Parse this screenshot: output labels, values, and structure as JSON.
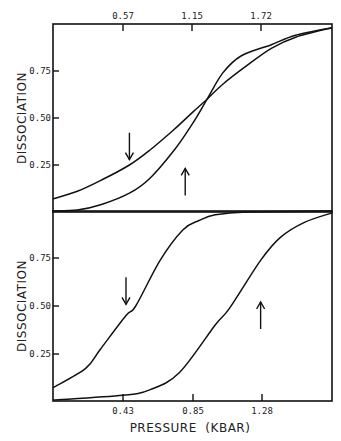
{
  "chart_data": [
    {
      "type": "line",
      "panel": "top",
      "title": "",
      "xlabel": "",
      "ylabel": "DISSOCIATION",
      "x_axis_position": "top",
      "xticks": [
        0.57,
        1.15,
        1.72
      ],
      "xtick_labels": [
        "0.57",
        "1.15",
        "1.72"
      ],
      "xlim": [
        0,
        2.3
      ],
      "yticks": [
        0.25,
        0.5,
        0.75
      ],
      "ytick_labels": [
        "0.25",
        "0.50",
        "0.75"
      ],
      "ylim": [
        0,
        1
      ],
      "grid": false,
      "series": [
        {
          "name": "decreasing pressure (down arrow)",
          "x": [
            0.0,
            0.2,
            0.4,
            0.63,
            0.8,
            1.0,
            1.15,
            1.27,
            1.4,
            1.6,
            1.8,
            2.0,
            2.3
          ],
          "values": [
            0.07,
            0.11,
            0.17,
            0.25,
            0.33,
            0.44,
            0.53,
            0.6,
            0.68,
            0.78,
            0.87,
            0.93,
            0.98
          ]
        },
        {
          "name": "increasing pressure (up arrow)",
          "x": [
            0.0,
            0.2,
            0.4,
            0.63,
            0.8,
            1.0,
            1.15,
            1.27,
            1.4,
            1.55,
            1.8,
            2.0,
            2.3
          ],
          "values": [
            0.005,
            0.01,
            0.04,
            0.1,
            0.18,
            0.33,
            0.47,
            0.6,
            0.74,
            0.83,
            0.89,
            0.94,
            0.98
          ]
        }
      ],
      "annotations": [
        {
          "type": "arrow-down",
          "x": 0.63,
          "y": 0.35
        },
        {
          "type": "arrow-up",
          "x": 1.09,
          "y": 0.16
        }
      ]
    },
    {
      "type": "line",
      "panel": "bottom",
      "title": "",
      "xlabel": "PRESSURE (KBAR)",
      "ylabel": "DISSOCIATION",
      "x_axis_position": "bottom",
      "xticks": [
        0.43,
        0.85,
        1.28
      ],
      "xtick_labels": [
        "0.43",
        "0.85",
        "1.28"
      ],
      "xlim": [
        0,
        1.72
      ],
      "yticks": [
        0.25,
        0.5,
        0.75
      ],
      "ytick_labels": [
        "0.25",
        "0.50",
        "0.75"
      ],
      "ylim": [
        0,
        1
      ],
      "grid": false,
      "series": [
        {
          "name": "decreasing pressure (down arrow)",
          "x": [
            0.0,
            0.2,
            0.29,
            0.45,
            0.51,
            0.66,
            0.8,
            0.9,
            1.0,
            1.2,
            1.72
          ],
          "values": [
            0.07,
            0.17,
            0.27,
            0.45,
            0.5,
            0.74,
            0.9,
            0.95,
            0.98,
            0.995,
            1.0
          ]
        },
        {
          "name": "increasing pressure (up arrow)",
          "x": [
            0.0,
            0.43,
            0.6,
            0.78,
            1.0,
            1.09,
            1.28,
            1.4,
            1.55,
            1.72
          ],
          "values": [
            0.005,
            0.03,
            0.06,
            0.15,
            0.4,
            0.49,
            0.74,
            0.86,
            0.94,
            0.99
          ]
        }
      ],
      "annotations": [
        {
          "type": "arrow-down",
          "x": 0.45,
          "y": 0.58
        },
        {
          "type": "arrow-up",
          "x": 1.28,
          "y": 0.45
        }
      ]
    }
  ],
  "labels": {
    "ylabel_top": "DISSOCIATION",
    "ylabel_bottom": "DISSOCIATION",
    "xlabel_bottom": "PRESSURE  (KBAR)",
    "top_xticks": [
      "0.57",
      "1.15",
      "1.72"
    ],
    "bottom_xticks": [
      "0.43",
      "0.85",
      "1.28"
    ],
    "yticks": [
      "0.75",
      "0.50",
      "0.25"
    ]
  }
}
